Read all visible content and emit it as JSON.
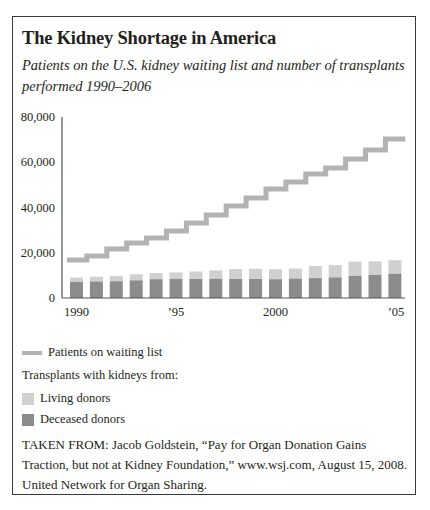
{
  "title": "The Kidney Shortage in America",
  "subtitle": "Patients on the U.S. kidney waiting list and number of transplants performed 1990–2006",
  "colors": {
    "waiting_list": "#b3b3b3",
    "living_donors": "#d0d0d0",
    "deceased_donors": "#8c8c8c",
    "axis": "#555555",
    "frame": "#3a3a3a"
  },
  "legend": {
    "waiting_list": "Patients on waiting list",
    "transplants_heading": "Transplants with kidneys from:",
    "living": "Living donors",
    "deceased": "Deceased donors"
  },
  "source": "TAKEN FROM: Jacob Goldstein, “Pay for Organ Donation Gains Traction, but not at Kidney Foundation,” www.wsj.com, August 15, 2008. United Network for Organ Sharing.",
  "chart_data": {
    "type": "bar",
    "title": "The Kidney Shortage in America",
    "subtitle": "Patients on the U.S. kidney waiting list and number of transplants performed 1990–2006",
    "xlabel": "",
    "ylabel": "",
    "ylim": [
      0,
      80000
    ],
    "yticks": [
      0,
      20000,
      40000,
      60000,
      80000
    ],
    "ytick_labels": [
      "0",
      "20,000",
      "40,000",
      "60,000",
      "80,000"
    ],
    "xtick_labels": [
      {
        "label": "1990",
        "index": 0
      },
      {
        "label": "’95",
        "index": 5
      },
      {
        "label": "2000",
        "index": 10
      },
      {
        "label": "’05",
        "index": 16
      }
    ],
    "grid": false,
    "legend_position": "below",
    "categories": [
      "1990",
      "1991",
      "1992",
      "1993",
      "1994",
      "1995",
      "1996",
      "1997",
      "1998",
      "1999",
      "2000",
      "2001",
      "2002",
      "2003",
      "2004",
      "2005",
      "2006"
    ],
    "series": [
      {
        "name": "Deceased donors",
        "kind": "stacked-bar",
        "values": [
          7100,
          7300,
          7400,
          7800,
          8300,
          8400,
          8400,
          8500,
          8400,
          8400,
          8300,
          8600,
          8800,
          9100,
          9800,
          10200,
          10700
        ]
      },
      {
        "name": "Living donors",
        "kind": "stacked-bar",
        "values": [
          1900,
          2100,
          2300,
          2700,
          2700,
          2900,
          3300,
          3700,
          4400,
          4500,
          4400,
          4400,
          5300,
          5500,
          6300,
          6000,
          6000
        ]
      },
      {
        "name": "Patients on waiting list",
        "kind": "step-line",
        "values": [
          16800,
          18600,
          21700,
          24300,
          26500,
          29600,
          33100,
          36700,
          40700,
          44200,
          48200,
          51300,
          54800,
          57500,
          61400,
          65400,
          70300
        ]
      }
    ]
  }
}
